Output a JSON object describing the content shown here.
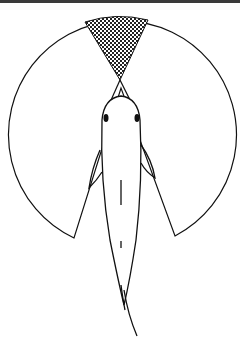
{
  "diagram": {
    "elements": {
      "visual_field_circle": {
        "cx": 121,
        "cy": 135,
        "r": 114
      },
      "blind_wedge_rear": {
        "from_left": [
          74,
          238
        ],
        "to_right": [
          175,
          236
        ],
        "apex": [
          121,
          88
        ]
      },
      "binocular_zone_front": {
        "pattern": "crosshatch",
        "left": [
          85,
          22
        ],
        "right": [
          148,
          20
        ],
        "apex": [
          120,
          80
        ]
      },
      "fish_body": {
        "orientation": "head-up",
        "head_top": [
          121,
          95
        ],
        "tail_tip": [
          137,
          336
        ]
      }
    },
    "colors": {
      "line": "#111111",
      "hatch": "#222222",
      "background": "#ffffff",
      "border": "#3a3a3a"
    }
  }
}
